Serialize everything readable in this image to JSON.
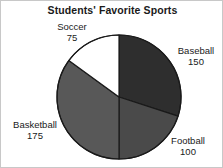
{
  "chart_data": {
    "type": "pie",
    "title": "Students' Favorite Sports",
    "xlabel": "",
    "ylabel": "",
    "legend_position": "none",
    "grid": false,
    "total": 500,
    "start_angle_deg": 0,
    "direction": "clockwise",
    "categories": [
      "Baseball",
      "Football",
      "Basketball",
      "Soccer"
    ],
    "values": [
      150,
      100,
      175,
      75
    ],
    "slices": [
      {
        "label": "Baseball",
        "value": "150",
        "value_number": 150,
        "percent": 30,
        "angle_deg": 108,
        "start_deg": 0,
        "end_deg": 108,
        "color": "#2e2e2e",
        "label_position": "right"
      },
      {
        "label": "Football",
        "value": "100",
        "value_number": 100,
        "percent": 20,
        "angle_deg": 72,
        "start_deg": 108,
        "end_deg": 180,
        "color": "#4a4a4a",
        "label_position": "bottom-right"
      },
      {
        "label": "Basketball",
        "value": "175",
        "value_number": 175,
        "percent": 35,
        "angle_deg": 126,
        "start_deg": 180,
        "end_deg": 306,
        "color": "#585858",
        "label_position": "left"
      },
      {
        "label": "Soccer",
        "value": "75",
        "value_number": 75,
        "percent": 15,
        "angle_deg": 54,
        "start_deg": 306,
        "end_deg": 360,
        "color": "#ffffff",
        "label_position": "top-left"
      }
    ],
    "outline_color": "#1a1a1a",
    "background_color": "#ffffff"
  }
}
